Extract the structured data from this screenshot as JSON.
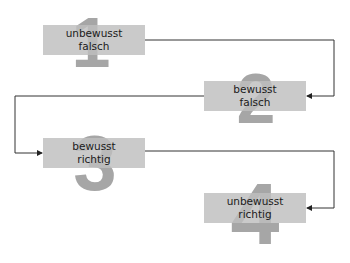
{
  "diagram": {
    "stages": [
      {
        "number": "1",
        "line1": "unbewusst",
        "line2": "falsch"
      },
      {
        "number": "2",
        "line1": "bewusst",
        "line2": "falsch"
      },
      {
        "number": "3",
        "line1": "bewusst",
        "line2": "richtig"
      },
      {
        "number": "4",
        "line1": "unbewusst",
        "line2": "richtig"
      }
    ],
    "colors": {
      "box": "#bebebe",
      "digit": "#a6a6a6",
      "line": "#333333"
    }
  }
}
